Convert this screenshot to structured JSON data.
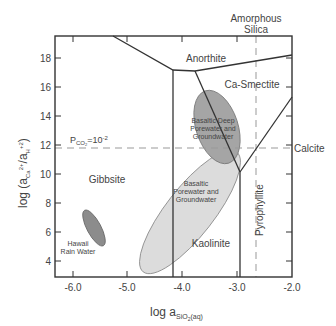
{
  "diagram": {
    "type": "activity-diagram",
    "x_axis": {
      "label_main": "log a",
      "label_sub": "SiO",
      "label_sub2": "2",
      "label_sub3": "(aq)",
      "ticks": [
        "-6.0",
        "-5.0",
        "-4.0",
        "-3.0",
        "-2.0"
      ]
    },
    "y_axis": {
      "label_prefix": "log (a",
      "label_ca": "Ca",
      "label_ca_sup": "2+",
      "label_mid": "/a",
      "label_h": "H",
      "label_h_sup": "+",
      "label_sq": "2",
      "label_close": ")",
      "ticks": [
        "18",
        "16",
        "14",
        "12",
        "10",
        "8",
        "6",
        "4"
      ]
    },
    "regions": {
      "anorthite": "Anorthite",
      "ca_smectite": "Ca-Smectite",
      "gibbsite": "Gibbsite",
      "kaolinite": "Kaolinite",
      "pyrophyllite": "Pyrophyllite"
    },
    "reference_lines": {
      "amorphous_silica_1": "Amorphous",
      "amorphous_silica_2": "Silica",
      "calcite": "Calcite",
      "pco2_p": "P",
      "pco2_sub": "CO",
      "pco2_sub2": "2",
      "pco2_val": "=10",
      "pco2_exp": "-2"
    },
    "fields": {
      "deep_1": "Basaltic Deep",
      "deep_2": "Porewater and",
      "deep_3": "Groundwater",
      "pore_1": "Basaltic",
      "pore_2": "Porewater and",
      "pore_3": "Groundwater",
      "rain_1": "Hawaii",
      "rain_2": "Rain Water"
    },
    "colors": {
      "dark_ellipse": "#9a9a9a",
      "light_ellipse": "#dcdcdc",
      "line": "#333333",
      "dashed": "#999999"
    }
  }
}
